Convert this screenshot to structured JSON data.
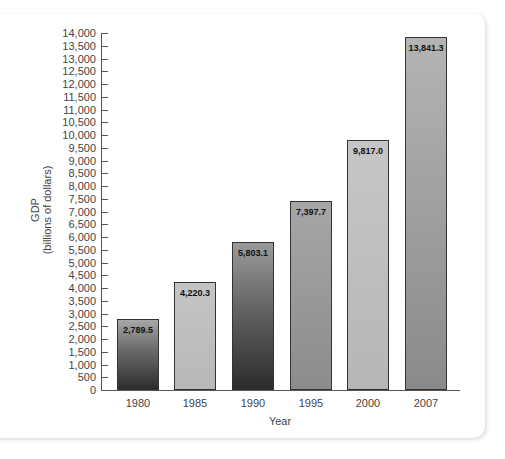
{
  "chart_data": {
    "type": "bar",
    "title": "",
    "xlabel": "Year",
    "ylabel": "GDP (billions of dollars)",
    "ylabel_lines": [
      "GDP",
      "(billions of dollars)"
    ],
    "categories": [
      "1980",
      "1985",
      "1990",
      "1995",
      "2000",
      "2007"
    ],
    "values": [
      2789.5,
      4220.3,
      5803.1,
      7397.7,
      9817.0,
      13841.3
    ],
    "value_labels": [
      "2,789.5",
      "4,220.3",
      "5,803.1",
      "7,397.7",
      "9,817.0",
      "13,841.3"
    ],
    "ylim": [
      0,
      14000
    ],
    "ytick_step": 500,
    "yticks": [
      "0",
      "500",
      "1,000",
      "1,500",
      "2,000",
      "2,500",
      "3,000",
      "3,500",
      "4,000",
      "4,500",
      "5,000",
      "5,500",
      "6,000",
      "6,500",
      "7,000",
      "7,500",
      "8,000",
      "8,500",
      "9,000",
      "9,500",
      "10,000",
      "10,500",
      "11,000",
      "11,500",
      "12,000",
      "12,500",
      "13,000",
      "13,500",
      "14,000"
    ],
    "grid": false,
    "legend": null,
    "bar_fills": [
      "linear-gradient(to bottom, #a8a8a8 0%, #6e6e6e 40%, #2e2e2e 100%)",
      "linear-gradient(to bottom, #c4c4c4 0%, #b8b8b8 100%)",
      "linear-gradient(to bottom, #9a9a9a 0%, #5e5e5e 50%, #2c2c2c 100%)",
      "linear-gradient(to bottom, #a6a6a6 0%, #8c8c8c 100%)",
      "linear-gradient(to bottom, #c6c6c6 0%, #b6b6b6 100%)",
      "linear-gradient(to bottom, #b4b4b4 0%, #8a8a8a 100%)"
    ]
  }
}
